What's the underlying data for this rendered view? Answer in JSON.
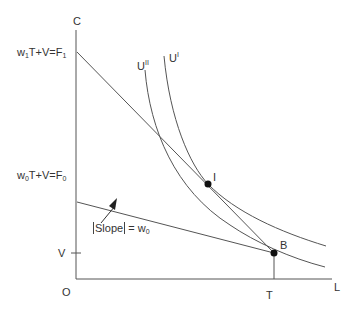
{
  "diagram": {
    "type": "economics-budget-constraint",
    "axes": {
      "y_label": "C",
      "x_label": "L",
      "origin_label": "O"
    },
    "ticks": {
      "y_tick_label": "V",
      "x_tick_label": "T"
    },
    "budget_lines": [
      {
        "id": "F1",
        "label_pre": "w",
        "label_sub1": "1",
        "label_mid": "T+V=F",
        "label_sub2": "1"
      },
      {
        "id": "F0",
        "label_pre": "w",
        "label_sub1": "0",
        "label_mid": "T+V=F",
        "label_sub2": "0"
      }
    ],
    "indifference_curves": [
      {
        "id": "UI",
        "label_base": "U",
        "label_sup": "I"
      },
      {
        "id": "UII",
        "label_base": "U",
        "label_sup": "II"
      }
    ],
    "points": [
      {
        "id": "I",
        "label": "I"
      },
      {
        "id": "B",
        "label": "B"
      }
    ],
    "annotation": {
      "slope_text": "Slope",
      "equals": " = w",
      "sub": "0"
    },
    "colors": {
      "line": "#555555",
      "point": "#111111",
      "text": "#333333"
    }
  }
}
